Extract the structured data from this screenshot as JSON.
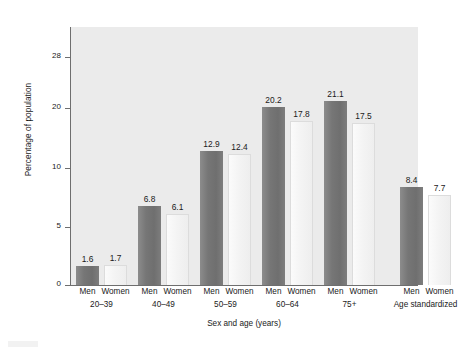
{
  "chart_data": {
    "type": "bar",
    "title": "",
    "subtitle": "",
    "xlabel": "Sex and age (years)",
    "ylabel": "Percentage of population",
    "ylim": [
      0,
      28
    ],
    "grid": false,
    "legend": "none",
    "ytick_labels": [
      "0",
      "5",
      "10",
      "20",
      "28"
    ],
    "ytick_values": [
      0,
      5,
      10,
      20,
      28
    ],
    "categories": [
      "20–39",
      "40–49",
      "50–59",
      "60–64",
      "75+",
      "Age standardized"
    ],
    "series": [
      {
        "name": "Men",
        "values": [
          1.6,
          6.8,
          12.9,
          20.2,
          21.1,
          8.4
        ]
      },
      {
        "name": "Women",
        "values": [
          1.7,
          6.1,
          12.4,
          17.8,
          17.5,
          7.7
        ]
      }
    ],
    "bars": [
      {
        "group": "20–39",
        "sex": "Men",
        "value": 1.6,
        "label": "1.6"
      },
      {
        "group": "20–39",
        "sex": "Women",
        "value": 1.7,
        "label": "1.7"
      },
      {
        "group": "40–49",
        "sex": "Men",
        "value": 6.8,
        "label": "6.8"
      },
      {
        "group": "40–49",
        "sex": "Women",
        "value": 6.1,
        "label": "6.1"
      },
      {
        "group": "50–59",
        "sex": "Men",
        "value": 12.9,
        "label": "12.9"
      },
      {
        "group": "50–59",
        "sex": "Women",
        "value": 12.4,
        "label": "12.4"
      },
      {
        "group": "60–64",
        "sex": "Men",
        "value": 20.2,
        "label": "20.2"
      },
      {
        "group": "60–64",
        "sex": "Women",
        "value": 17.8,
        "label": "17.8"
      },
      {
        "group": "75+",
        "sex": "Men",
        "value": 21.1,
        "label": "21.1"
      },
      {
        "group": "75+",
        "sex": "Women",
        "value": 17.5,
        "label": "17.5"
      },
      {
        "group": "Age standardized",
        "sex": "Men",
        "value": 8.4,
        "label": "8.4"
      },
      {
        "group": "Age standardized",
        "sex": "Women",
        "value": 7.7,
        "label": "7.7"
      }
    ],
    "sex_labels": [
      "Men",
      "Women"
    ],
    "colors": {
      "men_bar": "#767676",
      "women_bar": "#f4f4f4",
      "plot_background": "#ebebeb",
      "page_background": "#ffffff",
      "axis": "#6e6e6e",
      "text": "#1a1a1a"
    }
  }
}
